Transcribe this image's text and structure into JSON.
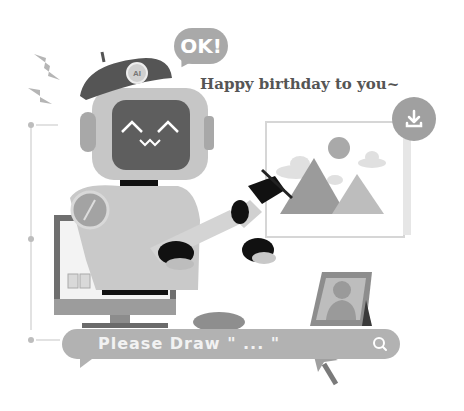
{
  "speech_bubble": {
    "text": "OK!"
  },
  "greeting": {
    "text": "Happy birthday to you~"
  },
  "beret_badge": {
    "text": "AI"
  },
  "search": {
    "placeholder_text": "Please Draw \" ... \""
  },
  "icons": {
    "download": "download-icon",
    "search": "search-icon",
    "cursor": "cursor-arrow-icon",
    "lightning": "lightning-icon"
  },
  "colors": {
    "bubble": "#a9a9a9",
    "search_bar": "#b2b2b2",
    "robot_body": "#c8c8c8",
    "robot_face": "#5e5e5e",
    "beret": "#555555",
    "accent_dark": "#1a1a1a"
  }
}
